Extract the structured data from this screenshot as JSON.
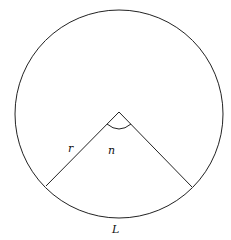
{
  "diagram": {
    "type": "circle-sector",
    "labels": {
      "radius": "r",
      "angle": "n",
      "arc": "L"
    },
    "colors": {
      "stroke": "#222222",
      "background": "#ffffff"
    }
  }
}
